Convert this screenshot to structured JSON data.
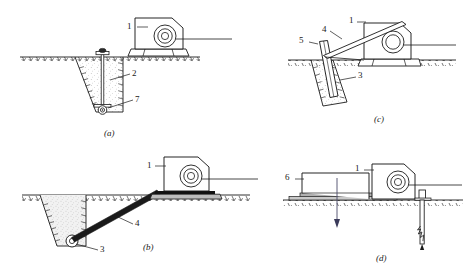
{
  "figure": {
    "type": "engineering-diagram",
    "panels": [
      {
        "id": "a",
        "letter": "(a)",
        "callouts": [
          {
            "id": "a-1",
            "text": "1"
          },
          {
            "id": "a-2",
            "text": "2"
          },
          {
            "id": "a-7",
            "text": "7"
          }
        ]
      },
      {
        "id": "b",
        "letter": "(b)",
        "callouts": [
          {
            "id": "b-1",
            "text": "1"
          },
          {
            "id": "b-4",
            "text": "4"
          },
          {
            "id": "b-3",
            "text": "3"
          }
        ]
      },
      {
        "id": "c",
        "letter": "(c)",
        "callouts": [
          {
            "id": "c-1",
            "text": "1"
          },
          {
            "id": "c-4",
            "text": "4"
          },
          {
            "id": "c-5",
            "text": "5"
          },
          {
            "id": "c-3",
            "text": "3"
          }
        ]
      },
      {
        "id": "d",
        "letter": "(d)",
        "callouts": [
          {
            "id": "d-1",
            "text": "1"
          },
          {
            "id": "d-6",
            "text": "6"
          }
        ]
      }
    ]
  },
  "colors": {
    "line": "#1a1a1a",
    "fill_white": "#ffffff",
    "fill_gray": "#9a9a9a",
    "fill_black": "#111111",
    "background": "#ffffff"
  }
}
